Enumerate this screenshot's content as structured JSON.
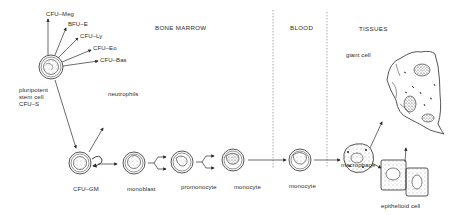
{
  "diagram": {
    "regions": [
      {
        "id": "bone-marrow",
        "label": "BONE MARROW"
      },
      {
        "id": "blood",
        "label": "BLOOD"
      },
      {
        "id": "tissues",
        "label": "TISSUES"
      }
    ],
    "stem_cell": {
      "label_lines": [
        "pluripotent",
        "stem cell",
        "CFU–S"
      ],
      "progeny": [
        "CFU–Meg",
        "BFU–E",
        "CFU–Ly",
        "CFU–Eo",
        "CFU–Bas"
      ]
    },
    "cells": [
      {
        "id": "cfu-gm",
        "label": "CFU–GM"
      },
      {
        "id": "monoblast",
        "label": "monoblast"
      },
      {
        "id": "promonocyte",
        "label": "promonocyte"
      },
      {
        "id": "monocyte-marrow",
        "label": "monocyte"
      },
      {
        "id": "monocyte-blood",
        "label": "monocyte"
      },
      {
        "id": "macrophage",
        "label": "macrophage"
      },
      {
        "id": "giant-cell",
        "label": "giant cell"
      },
      {
        "id": "epithelioid-cell",
        "label": "epithelioid cell"
      }
    ],
    "branch_label": "neutrophils",
    "colors": {
      "ink": "#2b2b2b",
      "background": "#ffffff",
      "dash": "#8a8a8a"
    }
  }
}
